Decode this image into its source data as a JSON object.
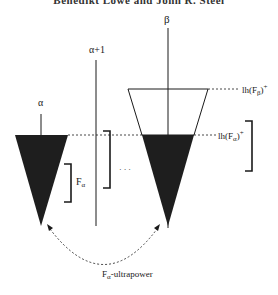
{
  "header": {
    "text": "Benedikt Löwe and John R. Steel"
  },
  "labels": {
    "beta": "β",
    "alpha_plus_one": "α+1",
    "alpha": "α",
    "f_alpha_base": "F",
    "f_alpha_sub": "α",
    "ellipsis": "· · ·",
    "lh_top_base": "lh(F",
    "lh_top_sub": "β",
    "lh_top_close": ")",
    "lh_top_sup": "+",
    "lh_mid_base": "lh(F",
    "lh_mid_sub": "α",
    "lh_mid_close": ")",
    "lh_mid_sup": "+",
    "caption_base": "F",
    "caption_sub": "α",
    "caption_rest": "-ultrapower"
  },
  "colors": {
    "ink": "#1a1a1a",
    "fill": "#1e1e1e",
    "background": "#ffffff"
  }
}
